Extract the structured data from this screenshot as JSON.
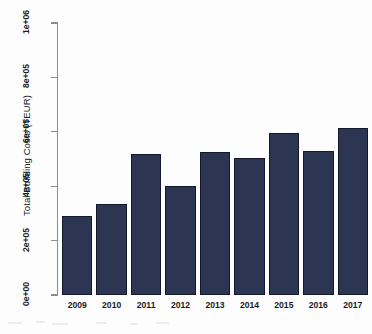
{
  "chart_data": {
    "type": "bar",
    "title": "",
    "subtitle": "",
    "xlabel": "",
    "ylabel": "Total Building Costs (TEUR)",
    "categories": [
      "2009",
      "2010",
      "2011",
      "2012",
      "2013",
      "2014",
      "2015",
      "2016",
      "2017"
    ],
    "values": [
      290000,
      335000,
      520000,
      400000,
      525000,
      505000,
      597000,
      530000,
      615000
    ],
    "ylim": [
      0,
      1000000
    ],
    "yticks": [
      0,
      200000,
      400000,
      600000,
      800000,
      1000000
    ],
    "ytick_labels": [
      "0e+00",
      "2e+05",
      "4e+05",
      "6e+05",
      "8e+05",
      "1e+06"
    ],
    "grid": false,
    "legend": false,
    "legend_position": "none",
    "bar_color": "#2c3652",
    "bar_edge_color": "#14192b",
    "axis_color": "#8d8d8d",
    "background_color": "#fdfdfd"
  }
}
